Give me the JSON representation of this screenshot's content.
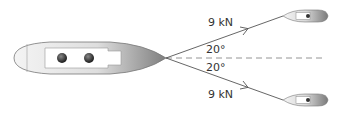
{
  "diagram": {
    "upper_rope": {
      "force_label": "9 kN",
      "angle_label": "20°"
    },
    "lower_rope": {
      "force_label": "9 kN",
      "angle_label": "20°"
    },
    "colors": {
      "line": "#555555",
      "hull_light": "#f2f2f2",
      "hull_dark": "#8a8a8a",
      "dash": "#888888"
    }
  }
}
